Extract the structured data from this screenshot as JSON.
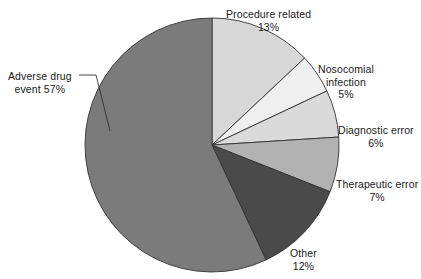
{
  "chart_data": {
    "type": "pie",
    "title": "",
    "subtitle": "",
    "xlabel": "",
    "ylabel": "",
    "legend_position": "none",
    "grid": false,
    "units": "percent",
    "start_angle_deg": 0,
    "direction": "clockwise",
    "center": {
      "x": 212,
      "y": 145
    },
    "radius": 127,
    "categories": [
      "Procedure related",
      "Nosocomial infection",
      "Diagnostic error",
      "Therapeutic error",
      "Other",
      "Adverse drug event"
    ],
    "values": [
      13,
      5,
      6,
      7,
      12,
      57
    ],
    "colors": [
      "#d7d7d7",
      "#efefef",
      "#dadada",
      "#b2b2b2",
      "#4a4a4a",
      "#7b7b7b"
    ],
    "slices": [
      {
        "label": "Procedure related",
        "value": 13,
        "value_text": "13%",
        "color": "#d7d7d7",
        "start_deg": 0,
        "end_deg": 46.8
      },
      {
        "label": "Nosocomial infection",
        "value": 5,
        "value_text": "5%",
        "color": "#efefef",
        "start_deg": 46.8,
        "end_deg": 64.8
      },
      {
        "label": "Diagnostic error",
        "value": 6,
        "value_text": "6%",
        "color": "#dadada",
        "start_deg": 64.8,
        "end_deg": 86.4
      },
      {
        "label": "Therapeutic error",
        "value": 7,
        "value_text": "7%",
        "color": "#b2b2b2",
        "start_deg": 86.4,
        "end_deg": 111.6
      },
      {
        "label": "Other",
        "value": 12,
        "value_text": "12%",
        "color": "#4a4a4a",
        "start_deg": 111.6,
        "end_deg": 154.8
      },
      {
        "label": "Adverse drug event",
        "value": 57,
        "value_text": "57%",
        "color": "#7b7b7b",
        "start_deg": 154.8,
        "end_deg": 360
      }
    ],
    "stroke_color": "#333333",
    "text_color": "#1a1a1a"
  },
  "labels": {
    "procedure_related": {
      "line1": "Procedure related",
      "line2": "13%"
    },
    "nosocomial_infection": {
      "line1": "Nosocomial",
      "line2": "infection",
      "line3": "5%"
    },
    "diagnostic_error": {
      "line1": "Diagnostic error",
      "line2": "6%"
    },
    "therapeutic_error": {
      "line1": "Therapeutic error",
      "line2": "7%"
    },
    "other": {
      "line1": "Other",
      "line2": "12%"
    },
    "adverse_drug_event": {
      "line1": "Adverse drug",
      "line2": "event 57%"
    }
  }
}
